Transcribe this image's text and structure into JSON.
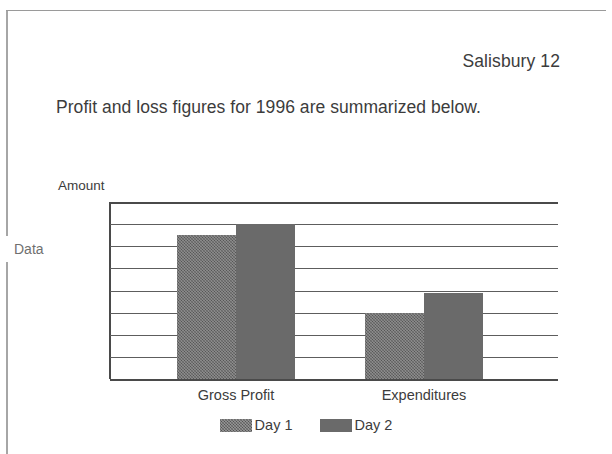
{
  "page": {
    "header_label": "Salisbury 12",
    "body_text": "Profit and loss figures for 1996 are summarized below.",
    "side_label": "Data"
  },
  "chart_data": {
    "type": "bar",
    "title": "",
    "ylabel": "Amount",
    "xlabel": "",
    "categories": [
      "Gross Profit",
      "Expenditures"
    ],
    "series": [
      {
        "name": "Day 1",
        "values": [
          3250,
          1500
        ],
        "fill": "textured",
        "color": "#676767"
      },
      {
        "name": "Day 2",
        "values": [
          3500,
          1950
        ],
        "fill": "solid",
        "color": "#6a6a6a"
      }
    ],
    "ylim": [
      0,
      4000
    ],
    "ytick_values": [
      0,
      500,
      1000,
      1500,
      2000,
      2500,
      3000,
      3500,
      4000
    ],
    "ytick_labels": [
      "0",
      "500",
      "1,000",
      "1,500",
      "2,000",
      "2,500",
      "3,000",
      "3,500",
      "4,000"
    ],
    "grid": true,
    "legend_position": "bottom",
    "legend": [
      "Day 1",
      "Day 2"
    ]
  }
}
